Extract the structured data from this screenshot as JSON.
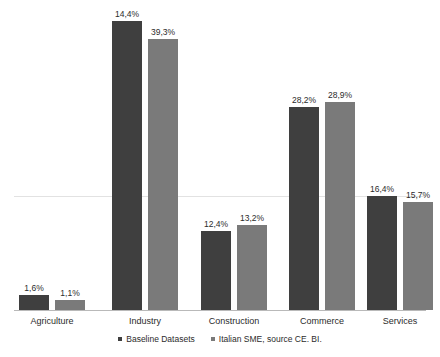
{
  "chart_data": {
    "type": "bar",
    "title": "",
    "subtitle": "",
    "xlabel": "",
    "ylabel": "",
    "grid": true,
    "legend_position": "bottom",
    "axis_visible": false,
    "categories": [
      "Agriculture",
      "Industry",
      "Construction",
      "Commerce",
      "Services"
    ],
    "series": [
      {
        "name": "Baseline Datasets",
        "color": "#3f3f3f",
        "values": [
          1.6,
          14.4,
          12.4,
          28.2,
          16.4
        ],
        "labels": [
          "1,6%",
          "14,4%",
          "12,4%",
          "28,2%",
          "16,4%"
        ],
        "bar_pixel_heights": [
          15,
          289,
          79,
          203,
          114
        ]
      },
      {
        "name": "Italian SME, source CE. BI.",
        "color": "#7a7a7a",
        "values": [
          1.1,
          39.3,
          13.2,
          28.9,
          15.7
        ],
        "labels": [
          "1,1%",
          "39,3%",
          "13,2%",
          "28,9%",
          "15,7%"
        ],
        "bar_pixel_heights": [
          10,
          271,
          85,
          208,
          108
        ]
      }
    ],
    "value_suffix": "%",
    "decimal_separator": ","
  },
  "legend": {
    "items": [
      {
        "label": "Baseline Datasets",
        "color": "#3f3f3f"
      },
      {
        "label": "Italian SME, source CE. BI.",
        "color": "#7a7a7a"
      }
    ]
  },
  "colors": {
    "series_dark": "#3f3f3f",
    "series_light": "#7a7a7a",
    "gridline": "#e2e2e2",
    "baseline": "#b9b9b9",
    "text": "#2b2b2b",
    "background": "#ffffff"
  }
}
